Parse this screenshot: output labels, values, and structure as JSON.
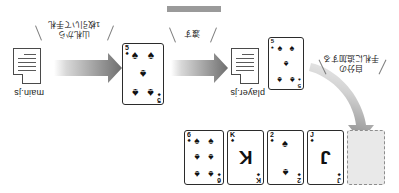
{
  "diagram": {
    "title_bar_color": "#9a9a9a",
    "orientation": "rotated-180",
    "files": [
      {
        "id": "main",
        "label": "main.js"
      },
      {
        "id": "player",
        "label": "player.js"
      }
    ],
    "annotations": [
      {
        "id": "draw",
        "text": "山札から\n1枚引いて手札"
      },
      {
        "id": "pass",
        "text": "渡す"
      },
      {
        "id": "add",
        "text": "自分の\n手札に追加する"
      }
    ],
    "hand": {
      "placeholder_label": "",
      "cards": [
        {
          "rank": "J",
          "suit": "♠",
          "pips": 0,
          "big": true
        },
        {
          "rank": "2",
          "suit": "♠",
          "pips": 2,
          "big": false
        },
        {
          "rank": "K",
          "suit": "♠",
          "pips": 0,
          "big": true
        },
        {
          "rank": "6",
          "suit": "♠",
          "pips": 6,
          "big": false
        }
      ]
    },
    "flow_cards": [
      {
        "id": "card-player",
        "rank": "5",
        "suit": "♠",
        "pips": 5
      },
      {
        "id": "card-main",
        "rank": "5",
        "suit": "♠",
        "pips": 5
      }
    ],
    "arrows": [
      {
        "id": "arrow-main-to-player",
        "direction": "left"
      },
      {
        "id": "arrow-player-to-card",
        "direction": "left"
      },
      {
        "id": "arrow-card-to-hand",
        "direction": "curved-up"
      }
    ]
  }
}
